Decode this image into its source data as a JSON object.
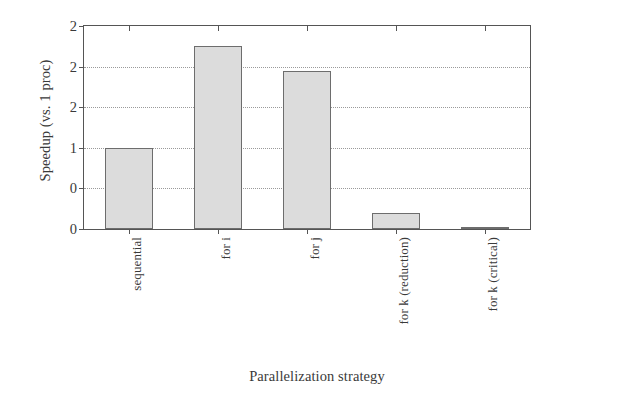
{
  "chart_data": {
    "type": "bar",
    "title": "",
    "xlabel": "Parallelization strategy",
    "ylabel": "Speedup (vs. 1 proc)",
    "categories": [
      "sequential",
      "for i",
      "for j",
      "for k (reduction)",
      "for k (critical)"
    ],
    "values": [
      1.0,
      2.25,
      1.95,
      0.2,
      0.03
    ],
    "ylim": [
      0,
      2.5
    ],
    "ytick_values": [
      0,
      0.5,
      1.0,
      1.5,
      2.0,
      2.5
    ],
    "ytick_labels": [
      "0",
      "0",
      "1",
      "2",
      "2",
      "2"
    ],
    "grid": true,
    "legend": "none",
    "bar_fill": "#dcdcdc",
    "bar_edge": "#6d6d6d",
    "axis_color": "#555555",
    "grid_color": "#9a9a9a",
    "text_color": "#3a3a3a"
  }
}
